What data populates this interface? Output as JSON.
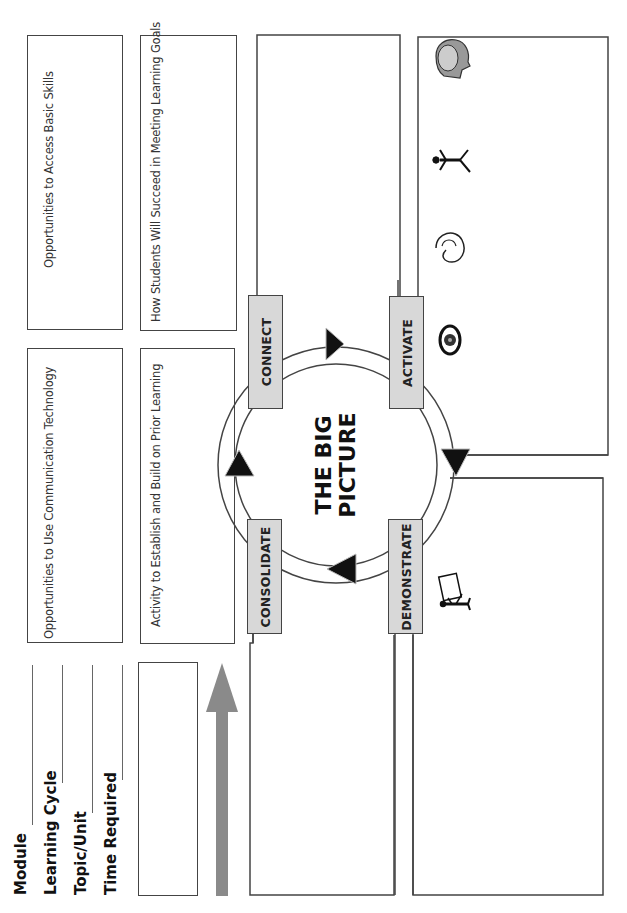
{
  "header_fields": [
    {
      "label": "Module"
    },
    {
      "label": "Learning Cycle"
    },
    {
      "label": "Topic/Unit"
    },
    {
      "label": "Time Required"
    }
  ],
  "boxes": {
    "basic_skills": "Opportunities to Access Basic Skills",
    "learning_goals": "How Students Will Succeed in Meeting Learning Goals",
    "communication_technology": "Opportunities to Use Communication Technology",
    "prior_learning": "Activity to Establish and Build on Prior Learning"
  },
  "center": {
    "title_line1": "THE BIG",
    "title_line2": "PICTURE"
  },
  "stages": {
    "connect": "CONNECT",
    "activate": "ACTIVATE",
    "demonstrate": "DEMONSTRATE",
    "consolidate": "CONSOLIDATE"
  },
  "activate_icons": [
    "eye-icon",
    "ear-icon",
    "walking-person-icon",
    "brain-head-icon"
  ],
  "demonstrate_icons": [
    "presenter-easel-icon"
  ],
  "colors": {
    "stage_fill": "#d8d8d8",
    "arrow_gray": "#8a8a8a",
    "border": "#444444",
    "cycle_arrowhead": "#111111"
  }
}
